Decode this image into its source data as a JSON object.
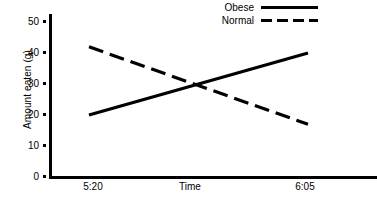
{
  "chart_data": {
    "type": "line",
    "title": "",
    "xlabel": "Time",
    "ylabel": "Amount eaten (g)",
    "x": [
      "5:20",
      "6:05"
    ],
    "xtick_labels": [
      "5:20",
      "6:05"
    ],
    "ytick_labels": [
      "0",
      "10",
      "20",
      "30",
      "40",
      "50"
    ],
    "ytick_values": [
      0,
      10,
      20,
      30,
      40,
      50
    ],
    "ylim": [
      0,
      55
    ],
    "grid": false,
    "legend_position": "top-right",
    "series": [
      {
        "name": "Obese",
        "style": "solid",
        "color": "#000000",
        "values": [
          20,
          40
        ]
      },
      {
        "name": "Normal",
        "style": "dashed",
        "color": "#000000",
        "values": [
          42,
          17
        ]
      }
    ],
    "annotations": {
      "crossing_point": {
        "y": 30,
        "between": "5:20 and 6:05"
      }
    }
  },
  "axes": {
    "y_label": "Amount eaten (g)",
    "x_label": "Time",
    "y_ticks": [
      {
        "label": "50",
        "value": 50
      },
      {
        "label": "40",
        "value": 40
      },
      {
        "label": "30",
        "value": 30
      },
      {
        "label": "20",
        "value": 20
      },
      {
        "label": "10",
        "value": 10
      },
      {
        "label": "0",
        "value": 0
      }
    ],
    "x_ticks": [
      {
        "label": "5:20"
      },
      {
        "label": "6:05"
      }
    ]
  },
  "legend": {
    "entries": [
      {
        "label": "Obese",
        "style": "solid"
      },
      {
        "label": "Normal",
        "style": "dashed"
      }
    ]
  },
  "colors": {
    "line": "#000000",
    "axis": "#000000",
    "background": "#ffffff"
  }
}
